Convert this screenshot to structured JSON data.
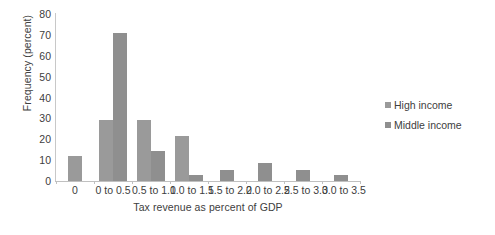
{
  "chart_data": {
    "type": "bar",
    "title": "",
    "xlabel": "Tax revenue as percent of GDP",
    "ylabel": "Frequency (percent)",
    "categories": [
      "0",
      "0 to 0.5",
      "0.5 to 1.0",
      "1.0 to 1.5",
      "1.5 to 2.0",
      "2.0 to 2.5",
      "2.5 to 3.0",
      "3.0 to 3.5"
    ],
    "series": [
      {
        "name": "High income",
        "color": "#9a9a9a",
        "values": [
          12,
          29,
          29,
          21.5,
          0,
          0,
          0,
          0
        ]
      },
      {
        "name": "Middle income",
        "color": "#8f8f8f",
        "values": [
          0,
          71,
          14.5,
          3,
          5.5,
          8.5,
          5.5,
          3
        ]
      }
    ],
    "ylim": [
      0,
      80
    ],
    "yticks": [
      0,
      10,
      20,
      30,
      40,
      50,
      60,
      70,
      80
    ],
    "ytick_labels": [
      "0",
      "10",
      "20",
      "30",
      "40",
      "50",
      "60",
      "70",
      "80"
    ],
    "grid": false,
    "legend_position": "right"
  },
  "legend": {
    "items": [
      {
        "label": "High income",
        "color": "#9a9a9a"
      },
      {
        "label": "Middle income",
        "color": "#8f8f8f"
      }
    ]
  }
}
